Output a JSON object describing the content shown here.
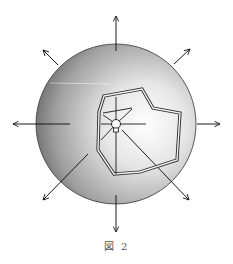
{
  "figure": {
    "caption": "図 2"
  },
  "colors": {
    "sphere_light": "#f4f4f4",
    "sphere_dark": "#6e6e6e",
    "stroke": "#1a1a1a"
  }
}
